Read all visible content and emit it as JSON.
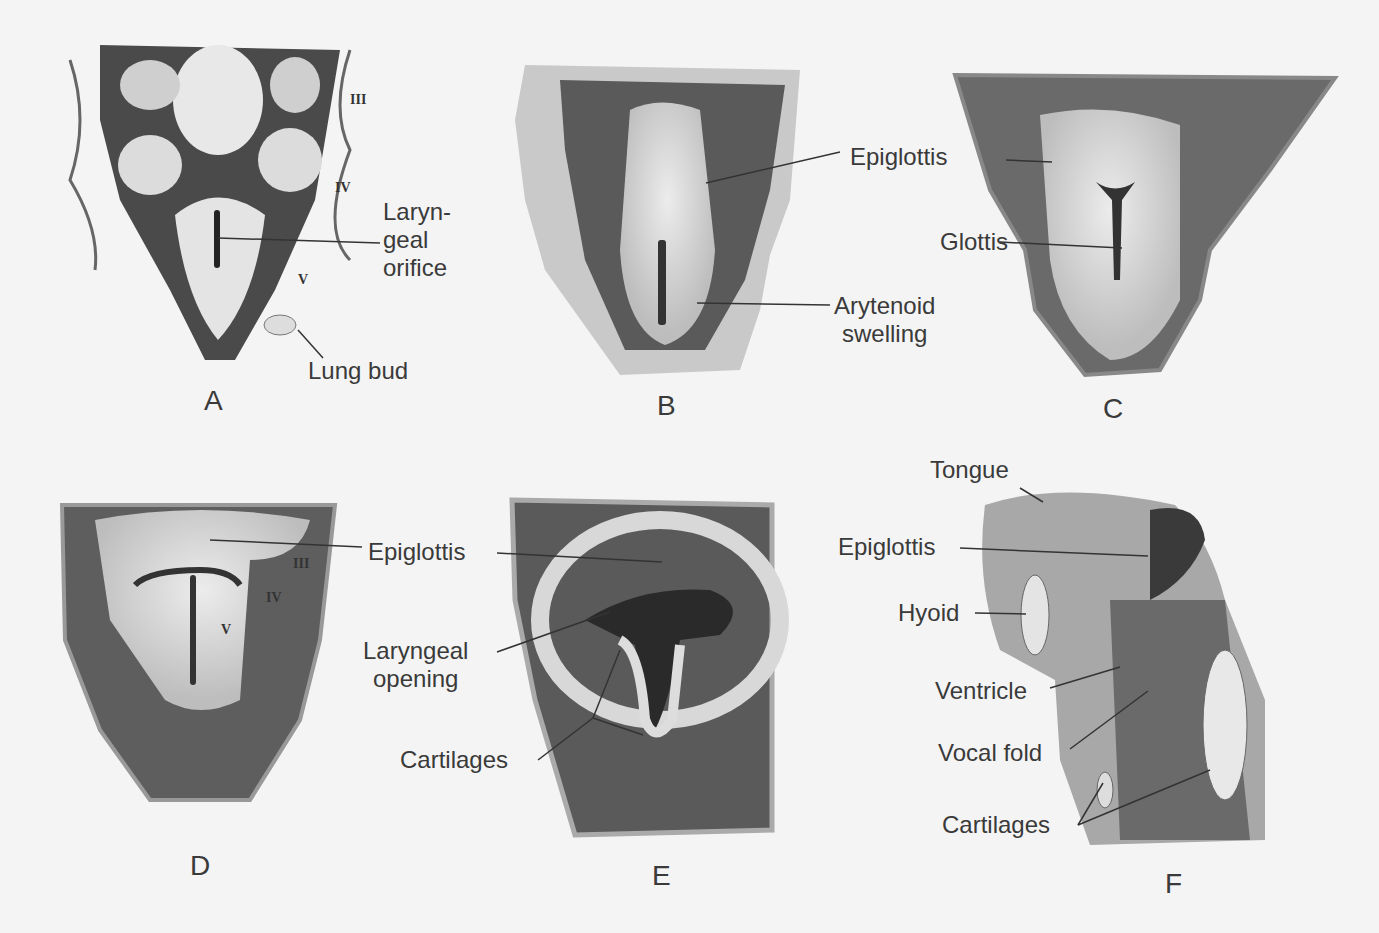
{
  "figure": {
    "panels": [
      {
        "id": "A",
        "letter": "A",
        "labels": {
          "orifice": "Laryn-\ngeal\norifice",
          "lung_bud": "Lung bud"
        },
        "arches": [
          "III",
          "IV",
          "V"
        ]
      },
      {
        "id": "B",
        "letter": "B",
        "labels": {
          "epiglottis": "Epiglottis",
          "arytenoid": "Arytenoid\nswelling"
        }
      },
      {
        "id": "C",
        "letter": "C",
        "labels": {
          "epiglottis": "Epiglottis",
          "glottis": "Glottis"
        }
      },
      {
        "id": "D",
        "letter": "D",
        "labels": {
          "epiglottis": "Epiglottis"
        },
        "arches": [
          "III",
          "IV",
          "V"
        ]
      },
      {
        "id": "E",
        "letter": "E",
        "labels": {
          "epiglottis": "Epiglottis",
          "laryngeal_opening": "Laryngeal\nopening",
          "cartilages": "Cartilages"
        }
      },
      {
        "id": "F",
        "letter": "F",
        "labels": {
          "tongue": "Tongue",
          "epiglottis": "Epiglottis",
          "hyoid": "Hyoid",
          "ventricle": "Ventricle",
          "vocal_fold": "Vocal fold",
          "cartilages": "Cartilages"
        }
      }
    ]
  },
  "colors": {
    "background": "#f4f4f4",
    "tissue_dark": "#4a4a4a",
    "tissue_mid": "#9a9a9a",
    "tissue_light": "#e8e8e8",
    "text": "#3a3a3a"
  }
}
